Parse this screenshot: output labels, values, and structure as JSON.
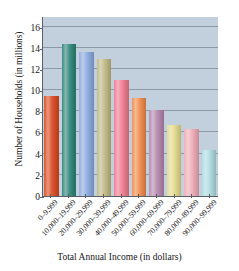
{
  "chart_data": {
    "type": "bar",
    "title": "",
    "xlabel": "Total Annual Income (in dollars)",
    "ylabel": "Number of Households (in millions)",
    "categories": [
      "0–9,999",
      "10,000–19,999",
      "20,000–29,999",
      "30,000–39,999",
      "40,000–49,999",
      "50,000–59,999",
      "60,000–69,999",
      "70,000–79,999",
      "80,000–89,999",
      "90,000–99,999"
    ],
    "values": [
      9.4,
      14.4,
      13.6,
      12.9,
      11.0,
      9.3,
      8.1,
      6.7,
      6.3,
      4.3
    ],
    "bar_colors": [
      "#d94a20",
      "#2e8578",
      "#8ba9dd",
      "#c0b884",
      "#ef7b8e",
      "#f08a4b",
      "#b387ae",
      "#e3d98a",
      "#efaab6",
      "#aedbe0"
    ],
    "ylim": [
      0,
      17
    ],
    "yticks": [
      0,
      2,
      4,
      6,
      8,
      10,
      12,
      14,
      16
    ],
    "ytick_labels": [
      "0",
      "2",
      "4",
      "6",
      "8",
      "10",
      "12",
      "14",
      "16"
    ],
    "grid": true,
    "grid_color": "#8d9aa6",
    "plot_background": "#c2d0dd",
    "axis_color": "#5a5f66",
    "legend": null
  }
}
